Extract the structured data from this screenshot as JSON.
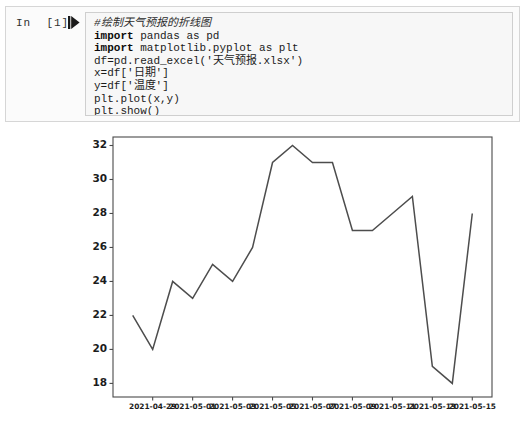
{
  "notebook": {
    "prompt_label": "In  [1]:",
    "run_icon": "run-cell-icon",
    "code_lines": [
      {
        "text": "#绘制天气预报的折线图",
        "style": "comment"
      },
      {
        "text": "import pandas as pd",
        "style": "code",
        "keyword": "import"
      },
      {
        "text": "import matplotlib.pyplot as plt",
        "style": "code",
        "keyword": "import"
      },
      {
        "text": "df=pd.read_excel('天气预报.xlsx')",
        "style": "code"
      },
      {
        "text": "x=df['日期']",
        "style": "code"
      },
      {
        "text": "y=df['温度']",
        "style": "code"
      },
      {
        "text": "plt.plot(x,y)",
        "style": "code"
      },
      {
        "text": "plt.show()",
        "style": "code"
      }
    ]
  },
  "chart_data": {
    "type": "line",
    "title": "",
    "xlabel": "",
    "ylabel": "",
    "x": [
      "2021-04-28",
      "2021-04-29",
      "2021-04-30",
      "2021-05-01",
      "2021-05-02",
      "2021-05-03",
      "2021-05-04",
      "2021-05-05",
      "2021-05-06",
      "2021-05-07",
      "2021-05-08",
      "2021-05-09",
      "2021-05-10",
      "2021-05-11",
      "2021-05-12",
      "2021-05-13",
      "2021-05-14",
      "2021-05-15"
    ],
    "values": [
      22,
      20,
      24,
      23,
      25,
      24,
      26,
      31,
      32,
      31,
      31,
      27,
      27,
      28,
      29,
      19,
      18,
      28
    ],
    "series": [
      {
        "name": "温度",
        "values": [
          22,
          20,
          24,
          23,
          25,
          24,
          26,
          31,
          32,
          31,
          31,
          27,
          27,
          28,
          29,
          19,
          18,
          28
        ]
      }
    ],
    "xtick_labels": [
      "2021-04-29",
      "2021-05-01",
      "2021-05-03",
      "2021-05-05",
      "2021-05-07",
      "2021-05-09",
      "2021-05-11",
      "2021-05-13",
      "2021-05-15"
    ],
    "ytick_labels": [
      "18",
      "20",
      "22",
      "24",
      "26",
      "28",
      "30",
      "32"
    ],
    "ylim": [
      17.2,
      32.5
    ],
    "xlim": [
      "2021-04-27.6",
      "2021-05-16.4"
    ],
    "grid": false,
    "legend": "none",
    "line_color": "#4d4d4d"
  },
  "colors": {
    "cell_background": "#fbfbfb",
    "input_background": "#f7f7f7",
    "input_border": "#cfcfcf",
    "figure_background": "#ffffff",
    "axis": "#4a4a4a",
    "line": "#4d4d4d",
    "text": "#1b1b1b"
  }
}
